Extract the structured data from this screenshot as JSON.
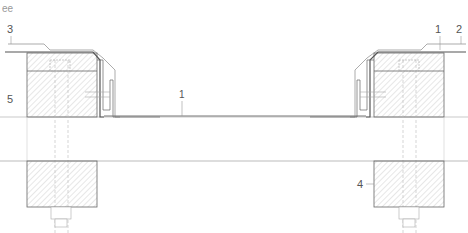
{
  "drawing": {
    "title": "ee",
    "labels": {
      "top_left": "3",
      "top_right_1": "1",
      "top_right_2": "2",
      "left_mid": "5",
      "center": "1",
      "right_lower": "4"
    }
  },
  "colors": {
    "line": "#555555",
    "light_line": "#aaaaaa",
    "hatch": "#bbbbbb"
  }
}
